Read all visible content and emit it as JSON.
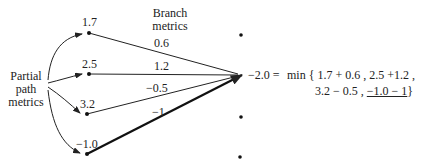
{
  "labels": {
    "partial_path": [
      "Partial",
      "path",
      "metrics"
    ],
    "branch": [
      "Branch",
      "metrics"
    ]
  },
  "nodes": [
    {
      "metric": "1.7",
      "branch": "0.6"
    },
    {
      "metric": "2.5",
      "branch": "1.2"
    },
    {
      "metric": "3.2",
      "branch": "−0.5"
    },
    {
      "metric": "−1.0",
      "branch": "−1"
    }
  ],
  "equation": {
    "result": "−2.0 =",
    "line1": "min { 1.7 + 0.6 , 2.5 +1.2 ,",
    "line2_prefix": "3.2 − 0.5 ,",
    "line2_selected": "−1.0 − 1",
    "line2_suffix": "}"
  },
  "colors": {
    "line": "#222222",
    "background": "#ffffff"
  }
}
